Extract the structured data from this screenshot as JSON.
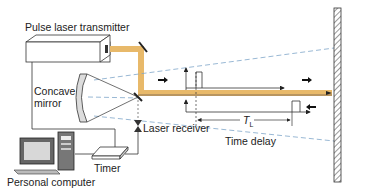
{
  "diagram": {
    "labels": {
      "transmitter": "Pulse laser transmitter",
      "mirror_line1": "Concave",
      "mirror_line2": "mirror",
      "receiver": "Laser receiver",
      "timer": "Timer",
      "computer": "Personal computer",
      "time_delay": "Time delay",
      "tl_symbol": "T",
      "tl_subscript": "L"
    },
    "colors": {
      "beam": "#e8b96a",
      "beam_return": "#c8a878",
      "dashed_field": "#7fa6c9",
      "line": "#333333",
      "target_fill": "#ffffff"
    },
    "components": [
      "pulse-laser-transmitter",
      "fold-mirror",
      "concave-mirror",
      "beam-splitter",
      "laser-receiver",
      "timer",
      "personal-computer",
      "target-wall"
    ]
  }
}
